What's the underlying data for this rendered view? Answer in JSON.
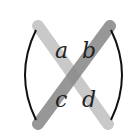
{
  "diagram": {
    "entries": {
      "a": "a",
      "b": "b",
      "c": "c",
      "d": "d"
    },
    "colors": {
      "main_diagonal": "#c9c9c9",
      "anti_diagonal": "#8c8c8c",
      "bracket": "#111111",
      "text": "#222222",
      "background": "#ffffff"
    }
  }
}
